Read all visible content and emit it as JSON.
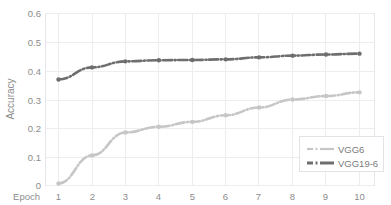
{
  "chart_data": {
    "type": "line",
    "title": "",
    "xlabel": "Epoch",
    "ylabel": "Accuracy",
    "x": [
      1,
      2,
      3,
      4,
      5,
      6,
      7,
      8,
      9,
      10
    ],
    "xticklabels": [
      "1",
      "2",
      "3",
      "4",
      "5",
      "6",
      "7",
      "8",
      "9",
      "10"
    ],
    "yticklabels": [
      "0",
      "0.1",
      "0.2",
      "0.3",
      "0.4",
      "0.5",
      "0.6"
    ],
    "yticks": [
      0,
      0.1,
      0.2,
      0.3,
      0.4,
      0.5,
      0.6
    ],
    "xlim": [
      0.6,
      10.4
    ],
    "ylim": [
      0,
      0.6
    ],
    "grid": true,
    "legend_position": "lower right",
    "series": [
      {
        "name": "VGG6",
        "color": "#c6c6c6",
        "marker": "circle",
        "linestyle": "dashdot",
        "values": [
          0.007,
          0.105,
          0.185,
          0.205,
          0.222,
          0.245,
          0.272,
          0.3,
          0.312,
          0.325
        ]
      },
      {
        "name": "VGG19-6",
        "color": "#6e6e6e",
        "marker": "circle",
        "linestyle": "dashdot",
        "values": [
          0.37,
          0.412,
          0.433,
          0.437,
          0.438,
          0.44,
          0.447,
          0.453,
          0.457,
          0.46
        ]
      }
    ]
  },
  "legend": {
    "entries": [
      {
        "label": "VGG6",
        "color": "#c6c6c6"
      },
      {
        "label": "VGG19-6",
        "color": "#6e6e6e"
      }
    ]
  },
  "axes": {
    "y_title": "Accuracy",
    "x_title": "Epoch"
  }
}
